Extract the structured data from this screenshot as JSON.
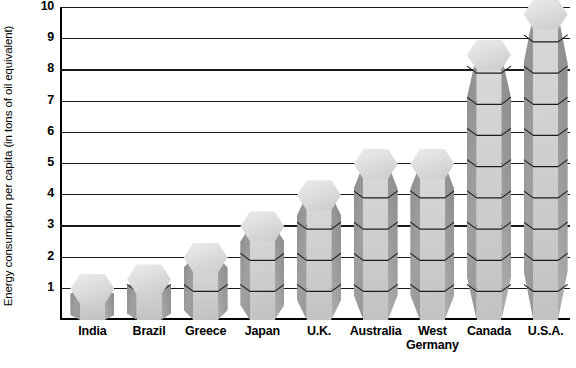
{
  "chart_data": {
    "type": "bar",
    "title": "",
    "xlabel": "",
    "ylabel": "Energy consumption per capita (in tons of oil equivalent)",
    "categories": [
      "India",
      "Brazil",
      "Greece",
      "Japan",
      "U.K.",
      "Australia",
      "West\nGermany",
      "Canada",
      "U.S.A."
    ],
    "values": [
      1.0,
      1.3,
      2.0,
      3.0,
      4.0,
      5.0,
      5.0,
      8.5,
      9.8
    ],
    "ylim": [
      0,
      10
    ],
    "yticks": [
      1,
      2,
      3,
      4,
      5,
      6,
      7,
      8,
      9,
      10
    ],
    "ytick_labels": [
      "1",
      "2",
      "3",
      "4",
      "5",
      "6",
      "7",
      "8",
      "9",
      "10"
    ],
    "grid": true,
    "legend": false,
    "style": "3d-stacked-blocks",
    "colors": {
      "block_front": "#cfcfcf",
      "block_top": "#e4e4e4",
      "block_side": "#979797",
      "gridline": "#1a1a1a",
      "axis": "#000000",
      "text": "#000000",
      "background": "#ffffff"
    }
  }
}
